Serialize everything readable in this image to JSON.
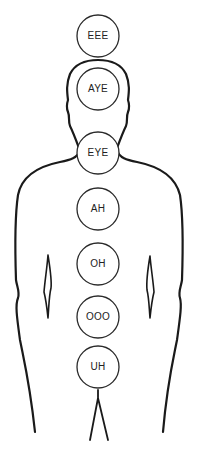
{
  "diagram": {
    "title": "",
    "colors": {
      "line": "#1a1a1a",
      "circle_stroke": "#2a2a2a",
      "background": "#ffffff",
      "text": "#222222"
    },
    "chakras": [
      {
        "label": "EEE",
        "cx": 98,
        "cy": 36
      },
      {
        "label": "AYE",
        "cx": 98,
        "cy": 89
      },
      {
        "label": "EYE",
        "cx": 98,
        "cy": 153
      },
      {
        "label": "AH",
        "cx": 98,
        "cy": 209
      },
      {
        "label": "OH",
        "cx": 98,
        "cy": 264
      },
      {
        "label": "OOO",
        "cx": 98,
        "cy": 317
      },
      {
        "label": "UH",
        "cx": 98,
        "cy": 367
      }
    ]
  }
}
